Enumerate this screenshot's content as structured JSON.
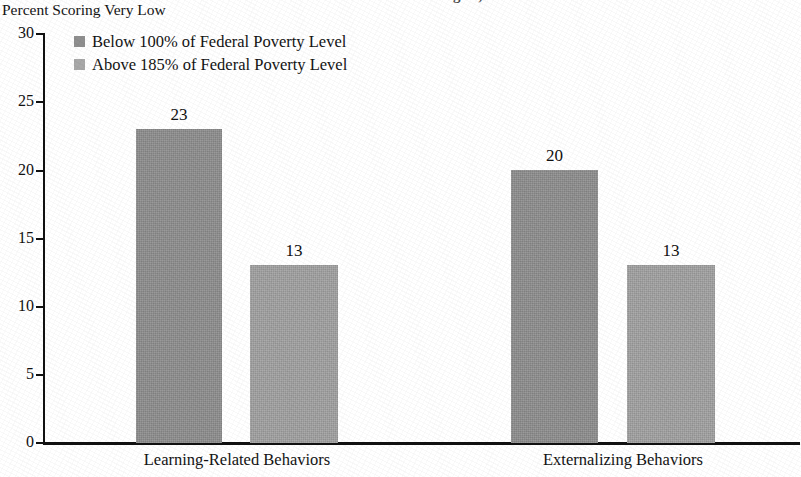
{
  "figure": {
    "clipped_top_title": "Behavioral Outcomes at Age 5, 2000",
    "y_axis_caption": "Percent Scoring Very Low"
  },
  "legend": {
    "position": "top-left-inside-plot",
    "entries": [
      {
        "label": "Below 100% of Federal Poverty Level",
        "color": "#8f8f8f"
      },
      {
        "label": "Above 185% of Federal Poverty Level",
        "color": "#a8a8a8"
      }
    ]
  },
  "axis": {
    "y_ticks": [
      "0",
      "5",
      "10",
      "15",
      "20",
      "25",
      "30"
    ]
  },
  "chart_data": {
    "type": "bar",
    "title": "Behavioral Outcomes at Age 5, 2000",
    "xlabel": "",
    "ylabel": "Percent Scoring Very Low",
    "ylim": [
      0,
      30
    ],
    "ytick_interval": 5,
    "grid": false,
    "legend_position": "upper left",
    "categories": [
      "Learning-Related Behaviors",
      "Externalizing Behaviors"
    ],
    "series": [
      {
        "name": "Below 100% of Federal Poverty Level",
        "color": "#8f8f8f",
        "values": [
          23,
          20
        ]
      },
      {
        "name": "Above 185% of Federal Poverty Level",
        "color": "#a8a8a8",
        "values": [
          13,
          13
        ]
      }
    ],
    "data_labels": [
      {
        "category": "Learning-Related Behaviors",
        "series": "Below 100% of Federal Poverty Level",
        "value": 23,
        "text": "23"
      },
      {
        "category": "Learning-Related Behaviors",
        "series": "Above 185% of Federal Poverty Level",
        "value": 13,
        "text": "13"
      },
      {
        "category": "Externalizing Behaviors",
        "series": "Below 100% of Federal Poverty Level",
        "value": 20,
        "text": "20"
      },
      {
        "category": "Externalizing Behaviors",
        "series": "Above 185% of Federal Poverty Level",
        "value": 13,
        "text": "13"
      }
    ]
  }
}
